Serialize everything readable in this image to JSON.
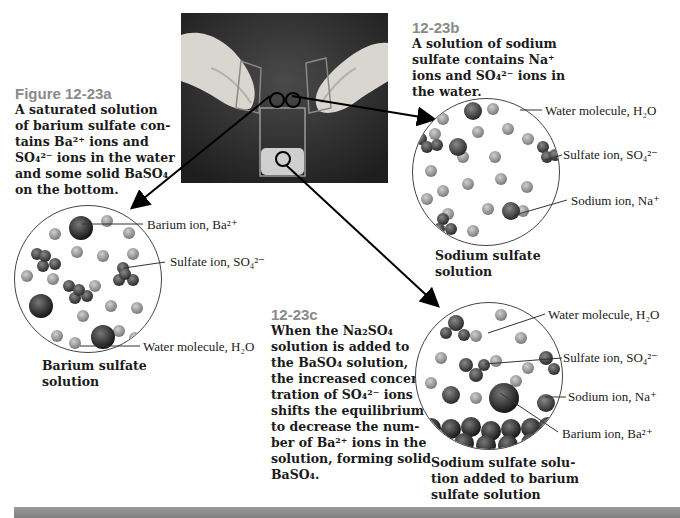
{
  "figure_a": {
    "label": "Figure 12-23a",
    "caption_lines": [
      "A saturated solution",
      "of barium sulfate con-",
      "tains Ba²⁺ ions and",
      "SO₄²⁻ ions in the water",
      "and some solid BaSO₄",
      "on the bottom."
    ],
    "diagram_labels": {
      "barium": "Barium ion, Ba²⁺",
      "sulfate": "Sulfate ion, SO₄²⁻",
      "water": "Water molecule, H₂O"
    },
    "title_lines": [
      "Barium sulfate",
      "solution"
    ]
  },
  "figure_b": {
    "label": "12-23b",
    "caption_lines": [
      "A solution of sodium",
      "sulfate contains Na⁺",
      "ions and SO₄²⁻ ions in",
      "the water."
    ],
    "diagram_labels": {
      "water": "Water molecule, H₂O",
      "sulfate": "Sulfate ion, SO₄²⁻",
      "sodium": "Sodium ion, Na⁺"
    },
    "title_lines": [
      "Sodium sulfate",
      "solution"
    ]
  },
  "figure_c": {
    "label": "12-23c",
    "caption_lines": [
      "When the Na₂SO₄",
      "solution is added to",
      "the BaSO₄ solution,",
      "the increased concen-",
      "tration of SO₄²⁻ ions",
      "shifts the equilibrium",
      "to decrease the num-",
      "ber of Ba²⁺ ions in the",
      "solution, forming solid",
      "BaSO₄."
    ],
    "diagram_labels": {
      "water": "Water molecule, H₂O",
      "sulfate": "Sulfate ion, SO₄²⁻",
      "sodium": "Sodium ion, Na⁺",
      "barium": "Barium ion, Ba²⁺"
    },
    "title_lines": [
      "Sodium sulfate solu-",
      "tion added to barium",
      "sulfate solution"
    ]
  },
  "photo": {
    "description": "gloved hands pouring two beakers into a beaker"
  },
  "colors": {
    "label_gray": "#8a8a8a",
    "band": "#8c8c8c",
    "photo_bg": "#2b2b2b"
  }
}
